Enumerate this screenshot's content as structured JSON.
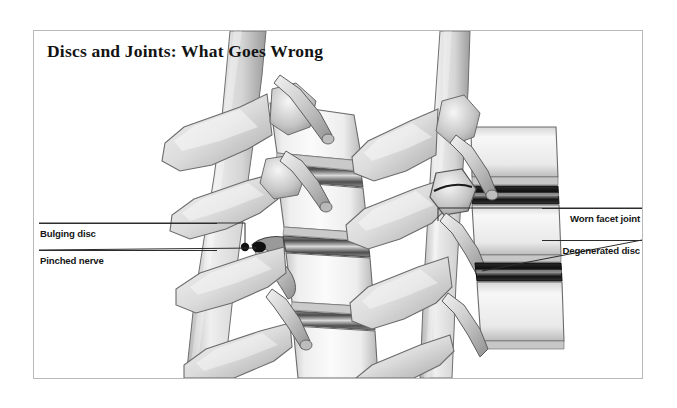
{
  "figure": {
    "title": "Discs and Joints: What Goes Wrong",
    "frame_border_color": "#b9b9ba",
    "background_color": "#ffffff",
    "ink_color": "#2c2c2c"
  },
  "callouts": {
    "left": [
      {
        "id": "bulging-disc",
        "label": "Bulging disc"
      },
      {
        "id": "pinched-nerve",
        "label": "Pinched nerve"
      }
    ],
    "right": [
      {
        "id": "worn-facet-joint",
        "label": "Worn facet joint"
      },
      {
        "id": "degenerated-disc",
        "label": "Degenerated disc"
      }
    ]
  },
  "panels": [
    {
      "id": "left-spine",
      "description": "lateral view lumbar spine with bulging disc and pinched nerve root"
    },
    {
      "id": "right-spine",
      "description": "lateral view lumbar spine with worn facet joint and degenerated disc"
    }
  ]
}
